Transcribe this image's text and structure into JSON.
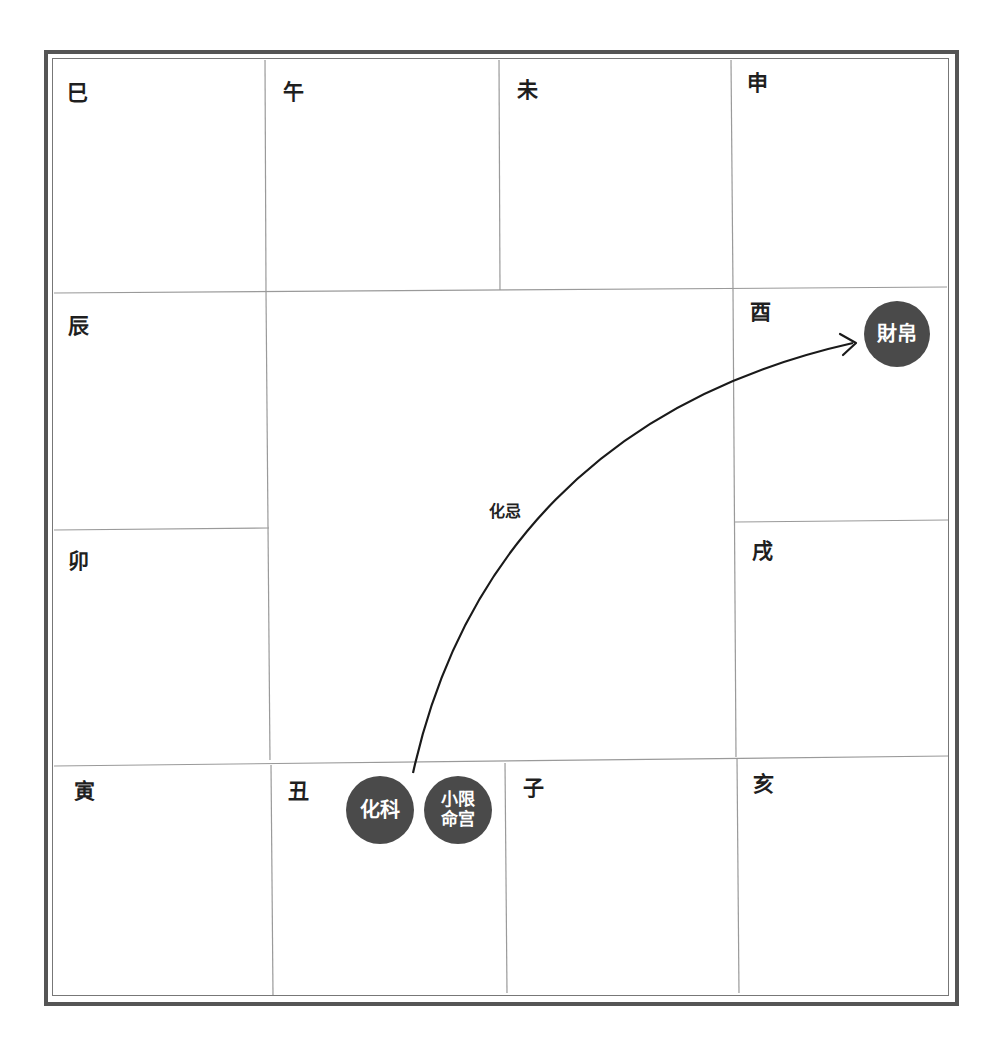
{
  "chart": {
    "palaces": [
      {
        "branch": "巳",
        "row": 0,
        "col": 0
      },
      {
        "branch": "午",
        "row": 0,
        "col": 1
      },
      {
        "branch": "未",
        "row": 0,
        "col": 2
      },
      {
        "branch": "申",
        "row": 0,
        "col": 3
      },
      {
        "branch": "辰",
        "row": 1,
        "col": 0
      },
      {
        "branch": "酉",
        "row": 1,
        "col": 3
      },
      {
        "branch": "卯",
        "row": 2,
        "col": 0
      },
      {
        "branch": "戌",
        "row": 2,
        "col": 3
      },
      {
        "branch": "寅",
        "row": 3,
        "col": 0
      },
      {
        "branch": "丑",
        "row": 3,
        "col": 1
      },
      {
        "branch": "子",
        "row": 3,
        "col": 2
      },
      {
        "branch": "亥",
        "row": 3,
        "col": 3
      }
    ],
    "badges": {
      "hua_ke": {
        "text": "化科",
        "palace": "丑"
      },
      "xiao_xian": {
        "line1": "小限",
        "line2": "命宫",
        "palace": "丑"
      },
      "cai_bo": {
        "text": "財帛",
        "palace": "酉"
      }
    },
    "arrow": {
      "label": "化忌",
      "from": "丑",
      "to": "酉"
    }
  },
  "colors": {
    "badge": "#4a4a4a",
    "line": "#999999",
    "frame": "#555555",
    "arrow": "#1a1a1a"
  }
}
